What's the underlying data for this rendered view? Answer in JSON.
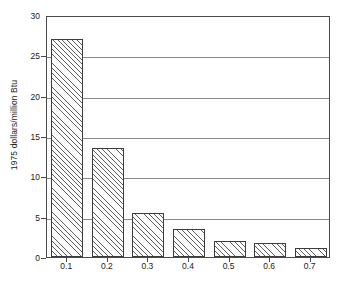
{
  "chart_data": {
    "type": "bar",
    "title": "",
    "xlabel": "",
    "ylabel": "1975 dollars/million Btu",
    "categories": [
      "0.1",
      "0.2",
      "0.3",
      "0.4",
      "0.5",
      "0.6",
      "0.7"
    ],
    "values": [
      27.0,
      13.5,
      5.5,
      3.5,
      2.0,
      1.7,
      1.1
    ],
    "ylim": [
      0,
      30
    ],
    "yticks": [
      0,
      5,
      10,
      15,
      20,
      25,
      30
    ],
    "ytick_labels": [
      "0",
      "5",
      "10",
      "15",
      "20",
      "25",
      "30"
    ],
    "grid": true,
    "legend": null,
    "bar_style": "hatched-diagonal",
    "colors": {
      "axis": "#4a4a4a",
      "grid": "#8a8a8a",
      "bar_edge": "#3c3c3c",
      "bar_hatch": "#5e5e5e",
      "background": "#ffffff",
      "text": "#1a1a1a"
    }
  },
  "axes": {
    "y_title": "1975 dollars/million Btu",
    "y_ticks": [
      "30",
      "25",
      "20",
      "15",
      "10",
      "5",
      "0"
    ],
    "x_ticks": [
      "0.1",
      "0.2",
      "0.3",
      "0.4",
      "0.5",
      "0.6",
      "0.7"
    ]
  },
  "title_fragment": ""
}
